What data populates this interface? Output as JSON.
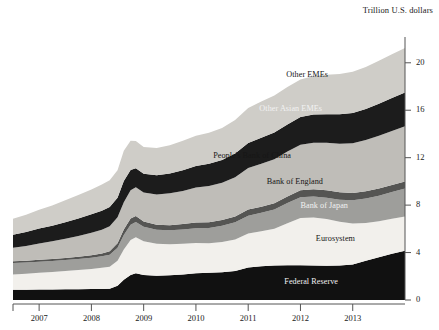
{
  "chart_data": {
    "type": "area",
    "title": "",
    "subtitle": "",
    "ylabel": "Trillion U.S. dollars",
    "xlabel": "",
    "stacked": true,
    "grid": false,
    "legend_position": "inline-labels",
    "ylim": [
      0,
      21.5
    ],
    "yticks": [
      0,
      4,
      8,
      12,
      16,
      20
    ],
    "ytick_labels": [
      "0",
      "4",
      "8",
      "12",
      "16",
      "20"
    ],
    "xlim": [
      2006.5,
      2014.0
    ],
    "xticks": [
      2007,
      2008,
      2009,
      2010,
      2011,
      2012,
      2013
    ],
    "xtick_labels": [
      "2007",
      "2008",
      "2009",
      "2010",
      "2011",
      "2012",
      "2013"
    ],
    "x": [
      2006.5,
      2006.75,
      2007.0,
      2007.25,
      2007.5,
      2007.75,
      2008.0,
      2008.2,
      2008.35,
      2008.5,
      2008.62,
      2008.75,
      2008.85,
      2009.0,
      2009.25,
      2009.5,
      2009.75,
      2010.0,
      2010.25,
      2010.5,
      2010.75,
      2011.0,
      2011.25,
      2011.5,
      2011.75,
      2012.0,
      2012.25,
      2012.5,
      2012.75,
      2013.0,
      2013.25,
      2013.5,
      2013.75,
      2014.0
    ],
    "series": [
      {
        "name": "Federal Reserve",
        "color": "#111111",
        "label_color": "light",
        "values": [
          0.86,
          0.87,
          0.88,
          0.89,
          0.9,
          0.91,
          0.92,
          0.93,
          0.95,
          1.2,
          1.7,
          2.1,
          2.25,
          2.1,
          2.05,
          2.08,
          2.15,
          2.25,
          2.3,
          2.35,
          2.45,
          2.75,
          2.85,
          2.9,
          2.92,
          2.92,
          2.9,
          2.88,
          2.9,
          3.0,
          3.3,
          3.6,
          3.9,
          4.15
        ]
      },
      {
        "name": "Eurosystem",
        "color": "#f2f0ec",
        "label_color": "dark",
        "values": [
          1.3,
          1.35,
          1.42,
          1.48,
          1.55,
          1.62,
          1.7,
          1.78,
          1.85,
          2.1,
          2.55,
          2.95,
          3.05,
          2.85,
          2.7,
          2.62,
          2.6,
          2.55,
          2.48,
          2.55,
          2.65,
          2.85,
          2.95,
          3.1,
          3.55,
          4.0,
          4.05,
          3.95,
          3.7,
          3.45,
          3.2,
          3.05,
          2.95,
          2.9
        ]
      },
      {
        "name": "Bank of Japan",
        "color": "#9e9e9b",
        "label_color": "light",
        "values": [
          0.95,
          0.94,
          0.93,
          0.92,
          0.92,
          0.93,
          0.95,
          0.98,
          1.02,
          1.1,
          1.22,
          1.3,
          1.28,
          1.22,
          1.18,
          1.18,
          1.2,
          1.25,
          1.3,
          1.35,
          1.45,
          1.5,
          1.55,
          1.62,
          1.7,
          1.75,
          1.78,
          1.8,
          1.85,
          1.95,
          2.05,
          2.15,
          2.25,
          2.35
        ]
      },
      {
        "name": "Bank of England",
        "color": "#555553",
        "label_color": "dark",
        "values": [
          0.15,
          0.15,
          0.16,
          0.16,
          0.17,
          0.18,
          0.2,
          0.24,
          0.3,
          0.38,
          0.48,
          0.52,
          0.5,
          0.45,
          0.42,
          0.43,
          0.45,
          0.48,
          0.48,
          0.49,
          0.5,
          0.52,
          0.52,
          0.53,
          0.55,
          0.58,
          0.6,
          0.62,
          0.63,
          0.62,
          0.61,
          0.6,
          0.6,
          0.6
        ]
      },
      {
        "name": "People's Bank of China",
        "color": "#bfbdb8",
        "label_color": "dark",
        "values": [
          1.15,
          1.25,
          1.38,
          1.5,
          1.62,
          1.75,
          1.9,
          2.0,
          2.1,
          2.2,
          2.3,
          2.38,
          2.42,
          2.45,
          2.55,
          2.68,
          2.8,
          2.95,
          3.05,
          3.15,
          3.3,
          3.5,
          3.62,
          3.72,
          3.8,
          3.85,
          3.92,
          4.0,
          4.1,
          4.2,
          4.32,
          4.45,
          4.55,
          4.65
        ]
      },
      {
        "name": "Other Asian EMEs",
        "color": "#1c1c1c",
        "label_color": "light",
        "values": [
          1.1,
          1.18,
          1.25,
          1.32,
          1.4,
          1.48,
          1.55,
          1.6,
          1.62,
          1.65,
          1.78,
          1.72,
          1.6,
          1.58,
          1.62,
          1.68,
          1.75,
          1.82,
          1.88,
          1.92,
          2.0,
          2.12,
          2.2,
          2.25,
          2.28,
          2.32,
          2.38,
          2.42,
          2.48,
          2.55,
          2.62,
          2.7,
          2.78,
          2.85
        ]
      },
      {
        "name": "Other EMEs",
        "color": "#cfcdc8",
        "label_color": "dark",
        "values": [
          1.35,
          1.45,
          1.58,
          1.7,
          1.85,
          1.98,
          2.1,
          2.2,
          2.25,
          2.32,
          2.55,
          2.45,
          2.3,
          2.25,
          2.3,
          2.38,
          2.48,
          2.55,
          2.62,
          2.7,
          2.82,
          2.95,
          3.05,
          3.12,
          3.15,
          3.18,
          3.25,
          3.32,
          3.4,
          3.48,
          3.55,
          3.62,
          3.7,
          3.75
        ]
      }
    ],
    "series_labels": [
      {
        "text": "Other EMEs",
        "x": 328,
        "y": 70,
        "tone": "dark"
      },
      {
        "text": "Other Asian EMEs",
        "x": 322,
        "y": 104,
        "tone": "light"
      },
      {
        "text": "People's Bank of China",
        "x": 291,
        "y": 151,
        "tone": "dark"
      },
      {
        "text": "Bank of England",
        "x": 323,
        "y": 177,
        "tone": "dark"
      },
      {
        "text": "Bank of Japan",
        "x": 348,
        "y": 201,
        "tone": "light"
      },
      {
        "text": "Eurosystem",
        "x": 355,
        "y": 234,
        "tone": "dark"
      },
      {
        "text": "Federal Reserve",
        "x": 338,
        "y": 277,
        "tone": "light"
      }
    ]
  },
  "axis": {
    "y_title": "Trillion U.S. dollars"
  }
}
